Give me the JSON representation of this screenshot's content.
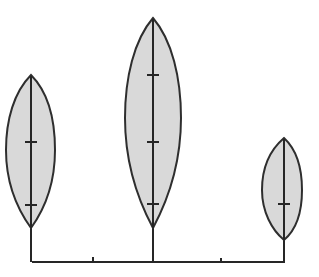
{
  "diagram": {
    "type": "botanical-leaf-comparison",
    "background_color": "#ffffff",
    "leaf_fill_color": "#d9d9d9",
    "line_color": "#262626",
    "leaves": [
      {
        "name": "left-leaf",
        "size": "medium",
        "tip": [
          31,
          75
        ],
        "base": [
          31,
          228
        ],
        "left_x": 6,
        "right_x": 55,
        "tick_marks_y": [
          142,
          205
        ]
      },
      {
        "name": "middle-leaf",
        "size": "large",
        "tip": [
          153,
          18
        ],
        "base": [
          153,
          228
        ],
        "left_x": 125,
        "right_x": 181,
        "tick_marks_y": [
          75,
          142,
          204
        ]
      },
      {
        "name": "right-leaf",
        "size": "small",
        "tip": [
          284,
          138
        ],
        "base": [
          284,
          240
        ],
        "left_x": 262,
        "right_x": 302,
        "tick_marks_y": [
          204
        ]
      }
    ],
    "baseline": {
      "y": 262,
      "x_start": 32,
      "x_end": 284,
      "minor_ticks_x": [
        93,
        221
      ]
    }
  }
}
